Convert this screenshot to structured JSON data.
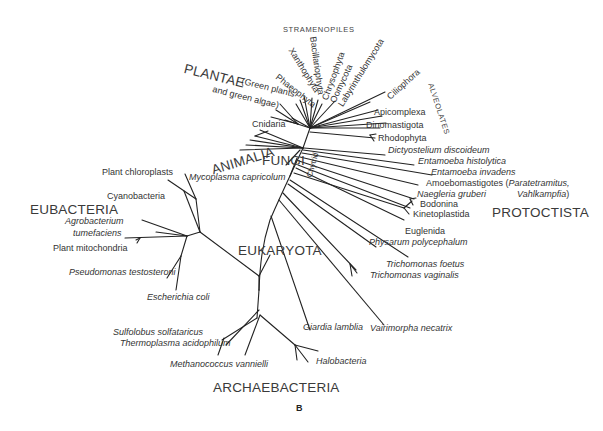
{
  "figure": {
    "panel_label": "B",
    "type": "unrooted phylogenetic tree"
  },
  "groups": {
    "stramenopiles": "STRAMENOPILES",
    "alveolates": "ALVEOLATES",
    "plantae": "PLANTAE",
    "plantae_note_1": "(Green plants",
    "plantae_note_2": "and green algae)",
    "animalia": "ANIMALIA",
    "fungi": "FUNGI",
    "eubacteria": "EUBACTERIA",
    "eukaryota": "EUKARYOTA",
    "protoctista": "PROTOCTISTA",
    "archaebacteria": "ARCHAEBACTERIA"
  },
  "taxa": {
    "xanthophyta": "Xanthophyta",
    "bacillariophyta": "Bacillariophyta",
    "chrysophyta": "Chrysophyta",
    "oomycota": "Oomycota",
    "labyrinthulomycota": "Labyrinthulomycota",
    "phaeophyta": "Phaeophyta",
    "ciliophora": "Ciliophora",
    "apicomplexa": "Apicomplexa",
    "dinomastigota": "Dinomastigota",
    "cnidaria": "Cnidaria",
    "rhodophyta": "Rhodophyta",
    "chytrid": "Chytrid",
    "dictyostelium": "Dictyostelium discoideum",
    "entamoeba_histolytica": "Entamoeba histolytica",
    "entamoeba_invadens": "Entamoeba invadens",
    "amoebomastigotes": "Amoebomastigotes (",
    "paratetramitus": "Paratetramitus,",
    "vahlkampfia": "Vahlkampfia",
    "vahlkampfia_close": ")",
    "naegleria": "Naegleria gruberi",
    "bodonina": "Bodonina",
    "kinetoplastida": "Kinetoplastida",
    "euglenida": "Euglenida",
    "physarum": "Physarum polycephalum",
    "trichomonas_foetus": "Trichomonas foetus",
    "trichomonas_vaginalis": "Trichomonas vaginalis",
    "vairimorpha": "Vairimorpha necatrix",
    "giardia": "Giardia lamblia",
    "mycoplasma": "Mycoplasma capricolum",
    "plant_chloroplasts": "Plant chloroplasts",
    "cyanobacteria": "Cyanobacteria",
    "agrobacterium_1": "Agrobacterium",
    "agrobacterium_2": "tumefaciens",
    "plant_mitochondria": "Plant mitochondria",
    "pseudomonas": "Pseudomonas testosteroni",
    "escherichia": "Escherichia coli",
    "sulfolobus": "Sulfolobus solfataricus",
    "thermoplasma": "Thermoplasma acidophilum",
    "methanococcus": "Methanococcus vannielli",
    "halobacteria": "Halobacteria"
  }
}
